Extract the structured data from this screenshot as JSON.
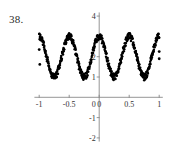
{
  "figure": {
    "problem_number": "38.",
    "background_color": "#ffffff",
    "point_color": "#000000",
    "axis_color": "#8a8a8a",
    "label_color": "#333333"
  },
  "chart_data": {
    "type": "scatter",
    "title": "",
    "subtitle": "",
    "xlabel": "",
    "ylabel": "",
    "xlim": [
      -1.12,
      1.08
    ],
    "ylim": [
      -2.3,
      4.3
    ],
    "grid": false,
    "legend": null,
    "x_ticks": [
      -1,
      -0.5,
      0,
      0.5,
      1
    ],
    "x_tick_labels": [
      "-1",
      "-0.5",
      "0",
      "0.5",
      "1"
    ],
    "y_ticks": [
      -2,
      -1,
      0,
      1,
      2,
      4
    ],
    "y_tick_labels": [
      "-2",
      "-1",
      "0",
      "1",
      "2",
      "4"
    ],
    "y_axis_position": 0,
    "x_axis_position": 0,
    "series_description": "noisy sinusoid, 4 cycles over x in [-1,1], mean 2, amplitude ~1",
    "model": {
      "mean_level": 2,
      "amplitude": 1,
      "cycles_over_domain": 4,
      "noise_amplitude": 0.16,
      "phase_offset_deg": 0
    },
    "x": [
      -1.0,
      -0.985,
      -0.97,
      -0.955,
      -0.94,
      -0.925,
      -0.91,
      -0.895,
      -0.88,
      -0.865,
      -0.85,
      -0.835,
      -0.82,
      -0.805,
      -0.79,
      -0.775,
      -0.76,
      -0.745,
      -0.73,
      -0.715,
      -0.7,
      -0.685,
      -0.67,
      -0.655,
      -0.64,
      -0.625,
      -0.61,
      -0.595,
      -0.58,
      -0.565,
      -0.55,
      -0.535,
      -0.52,
      -0.505,
      -0.49,
      -0.475,
      -0.46,
      -0.445,
      -0.43,
      -0.415,
      -0.4,
      -0.385,
      -0.37,
      -0.355,
      -0.34,
      -0.325,
      -0.31,
      -0.295,
      -0.28,
      -0.265,
      -0.25,
      -0.235,
      -0.22,
      -0.205,
      -0.19,
      -0.175,
      -0.16,
      -0.145,
      -0.13,
      -0.115,
      -0.1,
      -0.085,
      -0.07,
      -0.055,
      -0.04,
      -0.025,
      -0.01,
      0.005,
      0.02,
      0.035,
      0.05,
      0.065,
      0.08,
      0.095,
      0.11,
      0.125,
      0.14,
      0.155,
      0.17,
      0.185,
      0.2,
      0.215,
      0.23,
      0.245,
      0.26,
      0.275,
      0.29,
      0.305,
      0.32,
      0.335,
      0.35,
      0.365,
      0.38,
      0.395,
      0.41,
      0.425,
      0.44,
      0.455,
      0.47,
      0.485,
      0.5,
      0.515,
      0.53,
      0.545,
      0.56,
      0.575,
      0.59,
      0.605,
      0.62,
      0.635,
      0.65,
      0.665,
      0.68,
      0.695,
      0.71,
      0.725,
      0.74,
      0.755,
      0.77,
      0.785,
      0.8,
      0.815,
      0.83,
      0.845,
      0.86,
      0.875,
      0.89,
      0.905,
      0.92,
      0.935,
      0.95,
      0.965,
      0.98,
      1.0
    ],
    "y": [
      2.05,
      1.72,
      1.5,
      1.28,
      1.12,
      1.02,
      1.0,
      1.02,
      1.1,
      1.25,
      1.42,
      1.65,
      1.88,
      2.12,
      2.38,
      2.6,
      2.78,
      2.92,
      3.0,
      3.02,
      2.98,
      2.88,
      2.72,
      2.52,
      2.3,
      2.08,
      1.82,
      1.58,
      1.38,
      1.2,
      1.08,
      1.0,
      1.0,
      1.05,
      1.18,
      1.35,
      1.58,
      1.8,
      2.05,
      2.3,
      2.55,
      2.75,
      2.9,
      2.98,
      3.02,
      3.0,
      2.92,
      2.78,
      2.6,
      2.38,
      2.15,
      1.9,
      1.65,
      1.42,
      1.22,
      1.08,
      1.0,
      1.0,
      1.05,
      1.15,
      1.32,
      1.52,
      1.75,
      2.0,
      2.25,
      2.48,
      2.7,
      2.85,
      2.96,
      3.02,
      3.0,
      2.95,
      2.82,
      2.65,
      2.45,
      2.22,
      1.98,
      1.72,
      1.48,
      1.28,
      1.12,
      1.02,
      1.0,
      1.02,
      1.1,
      1.25,
      1.45,
      1.68,
      1.92,
      2.15,
      2.4,
      2.62,
      2.8,
      2.93,
      3.0,
      3.02,
      2.98,
      2.88,
      2.72,
      2.52,
      2.3,
      2.05,
      1.8,
      1.56,
      1.35,
      1.18,
      1.05,
      1.0,
      1.0,
      1.08,
      1.2,
      1.38,
      1.6,
      1.85,
      2.1,
      2.35,
      2.58,
      2.78,
      2.92,
      3.0,
      3.02,
      2.96,
      2.85,
      2.7,
      2.5,
      2.28,
      2.05,
      1.85,
      1.72,
      1.65,
      1.68,
      1.78,
      1.9
    ]
  }
}
